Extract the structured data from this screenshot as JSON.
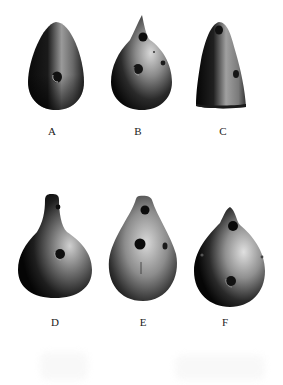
{
  "figure": {
    "background": "#ffffff",
    "items": [
      {
        "label": "A",
        "description": "egg-shaped vessel, one hole"
      },
      {
        "label": "B",
        "description": "egg-shaped vessel with pointed spout, holes"
      },
      {
        "label": "C",
        "description": "conical vessel, two holes"
      },
      {
        "label": "D",
        "description": "pear-shaped vessel with neck, two holes"
      },
      {
        "label": "E",
        "description": "teardrop vessel, three holes"
      },
      {
        "label": "F",
        "description": "teardrop vessel with spout, holes"
      }
    ]
  }
}
